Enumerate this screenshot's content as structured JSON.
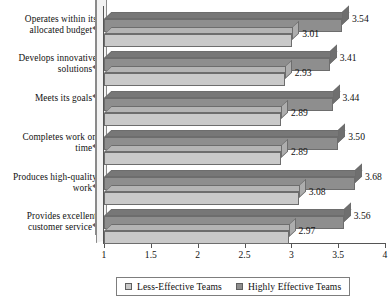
{
  "chart_data": {
    "type": "bar",
    "orientation": "horizontal",
    "title": "",
    "xlabel": "",
    "ylabel": "",
    "xlim": [
      1,
      4
    ],
    "xticks": [
      "1",
      "1.5",
      "2",
      "2.5",
      "3",
      "3.5",
      "4"
    ],
    "grid": false,
    "legend_position": "bottom",
    "categories": [
      "Operates within its\nallocated budget*",
      "Develops innovative\nsolutions*",
      "Meets its goals*",
      "Completes work on\ntime*",
      "Produces high-quality\nwork*",
      "Provides excellent\ncustomer service*"
    ],
    "series": [
      {
        "name": "Highly Effective Teams",
        "color": "#8e8e8e",
        "values": [
          3.54,
          3.41,
          3.44,
          3.5,
          3.68,
          3.56
        ],
        "labels": [
          "3.54",
          "3.41",
          "3.44",
          "3.50",
          "3.68",
          "3.56"
        ]
      },
      {
        "name": "Less-Effective Teams",
        "color": "#c9c9c9",
        "values": [
          3.01,
          2.93,
          2.89,
          2.89,
          3.08,
          2.97
        ],
        "labels": [
          "3.01",
          "2.93",
          "2.89",
          "2.89",
          "3.08",
          "2.97"
        ]
      }
    ]
  },
  "legend": {
    "entries": [
      {
        "label": "Less-Effective Teams",
        "swatch": "light"
      },
      {
        "label": "Highly Effective Teams",
        "swatch": "dark"
      }
    ]
  }
}
